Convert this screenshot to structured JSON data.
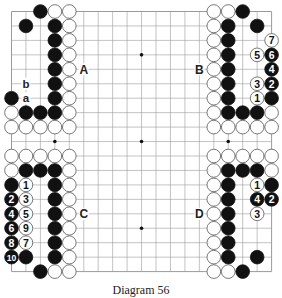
{
  "diagram": {
    "caption": "Diagram 56",
    "board_size": 19,
    "origin": {
      "x": 11.5,
      "y": 11.5
    },
    "spacing": 14.45,
    "colors": {
      "line": "#9a9a9a",
      "black": "#111111",
      "white": "#ffffff",
      "stone_outline": "#555555",
      "label": "#222222"
    },
    "star_points": [
      [
        3,
        3
      ],
      [
        9,
        3
      ],
      [
        15,
        3
      ],
      [
        3,
        9
      ],
      [
        9,
        9
      ],
      [
        15,
        9
      ],
      [
        3,
        15
      ],
      [
        9,
        15
      ],
      [
        15,
        15
      ]
    ],
    "region_labels": [
      {
        "text": "A",
        "col": 5,
        "row": 4
      },
      {
        "text": "B",
        "col": 13,
        "row": 4
      },
      {
        "text": "C",
        "col": 5,
        "row": 14
      },
      {
        "text": "D",
        "col": 13,
        "row": 14
      }
    ],
    "point_labels": [
      {
        "text": "b",
        "col": 1,
        "row": 5
      },
      {
        "text": "a",
        "col": 1,
        "row": 6
      }
    ],
    "stones": [
      {
        "c": "B",
        "col": 2,
        "row": 0
      },
      {
        "c": "W",
        "col": 3,
        "row": 0
      },
      {
        "c": "W",
        "col": 4,
        "row": 0
      },
      {
        "c": "B",
        "col": 1,
        "row": 1
      },
      {
        "c": "B",
        "col": 3,
        "row": 1
      },
      {
        "c": "W",
        "col": 4,
        "row": 1
      },
      {
        "c": "B",
        "col": 3,
        "row": 2
      },
      {
        "c": "W",
        "col": 4,
        "row": 2
      },
      {
        "c": "B",
        "col": 3,
        "row": 3
      },
      {
        "c": "W",
        "col": 4,
        "row": 3
      },
      {
        "c": "B",
        "col": 3,
        "row": 4
      },
      {
        "c": "W",
        "col": 4,
        "row": 4
      },
      {
        "c": "B",
        "col": 3,
        "row": 5
      },
      {
        "c": "W",
        "col": 4,
        "row": 5
      },
      {
        "c": "B",
        "col": 0,
        "row": 6
      },
      {
        "c": "B",
        "col": 3,
        "row": 6
      },
      {
        "c": "W",
        "col": 4,
        "row": 6
      },
      {
        "c": "W",
        "col": 0,
        "row": 7
      },
      {
        "c": "B",
        "col": 1,
        "row": 7
      },
      {
        "c": "B",
        "col": 2,
        "row": 7
      },
      {
        "c": "B",
        "col": 3,
        "row": 7
      },
      {
        "c": "W",
        "col": 4,
        "row": 7
      },
      {
        "c": "W",
        "col": 0,
        "row": 8
      },
      {
        "c": "W",
        "col": 1,
        "row": 8
      },
      {
        "c": "W",
        "col": 2,
        "row": 8
      },
      {
        "c": "W",
        "col": 3,
        "row": 8
      },
      {
        "c": "W",
        "col": 4,
        "row": 8
      },
      {
        "c": "W",
        "col": 14,
        "row": 0
      },
      {
        "c": "W",
        "col": 15,
        "row": 0
      },
      {
        "c": "B",
        "col": 16,
        "row": 0
      },
      {
        "c": "W",
        "col": 14,
        "row": 1
      },
      {
        "c": "B",
        "col": 15,
        "row": 1
      },
      {
        "c": "B",
        "col": 17,
        "row": 1
      },
      {
        "c": "W",
        "col": 14,
        "row": 2
      },
      {
        "c": "B",
        "col": 15,
        "row": 2
      },
      {
        "c": "W",
        "col": 18,
        "row": 2,
        "n": "7"
      },
      {
        "c": "W",
        "col": 14,
        "row": 3
      },
      {
        "c": "B",
        "col": 15,
        "row": 3
      },
      {
        "c": "W",
        "col": 17,
        "row": 3,
        "n": "5"
      },
      {
        "c": "B",
        "col": 18,
        "row": 3,
        "n": "6"
      },
      {
        "c": "W",
        "col": 14,
        "row": 4
      },
      {
        "c": "B",
        "col": 15,
        "row": 4
      },
      {
        "c": "B",
        "col": 18,
        "row": 4,
        "n": "4"
      },
      {
        "c": "W",
        "col": 14,
        "row": 5
      },
      {
        "c": "B",
        "col": 15,
        "row": 5
      },
      {
        "c": "W",
        "col": 17,
        "row": 5,
        "n": "3"
      },
      {
        "c": "B",
        "col": 18,
        "row": 5,
        "n": "2"
      },
      {
        "c": "W",
        "col": 14,
        "row": 6
      },
      {
        "c": "B",
        "col": 15,
        "row": 6
      },
      {
        "c": "W",
        "col": 17,
        "row": 6,
        "n": "1"
      },
      {
        "c": "B",
        "col": 18,
        "row": 6
      },
      {
        "c": "W",
        "col": 14,
        "row": 7
      },
      {
        "c": "B",
        "col": 15,
        "row": 7
      },
      {
        "c": "B",
        "col": 16,
        "row": 7
      },
      {
        "c": "B",
        "col": 17,
        "row": 7
      },
      {
        "c": "W",
        "col": 18,
        "row": 7
      },
      {
        "c": "W",
        "col": 14,
        "row": 8
      },
      {
        "c": "W",
        "col": 15,
        "row": 8
      },
      {
        "c": "W",
        "col": 16,
        "row": 8
      },
      {
        "c": "W",
        "col": 17,
        "row": 8
      },
      {
        "c": "W",
        "col": 18,
        "row": 8
      },
      {
        "c": "W",
        "col": 0,
        "row": 10
      },
      {
        "c": "W",
        "col": 1,
        "row": 10
      },
      {
        "c": "W",
        "col": 2,
        "row": 10
      },
      {
        "c": "W",
        "col": 3,
        "row": 10
      },
      {
        "c": "W",
        "col": 4,
        "row": 10
      },
      {
        "c": "W",
        "col": 0,
        "row": 11
      },
      {
        "c": "B",
        "col": 1,
        "row": 11
      },
      {
        "c": "B",
        "col": 2,
        "row": 11
      },
      {
        "c": "B",
        "col": 3,
        "row": 11
      },
      {
        "c": "W",
        "col": 4,
        "row": 11
      },
      {
        "c": "B",
        "col": 0,
        "row": 12
      },
      {
        "c": "W",
        "col": 1,
        "row": 12,
        "n": "1"
      },
      {
        "c": "B",
        "col": 3,
        "row": 12
      },
      {
        "c": "W",
        "col": 4,
        "row": 12
      },
      {
        "c": "B",
        "col": 0,
        "row": 13,
        "n": "2"
      },
      {
        "c": "W",
        "col": 1,
        "row": 13,
        "n": "3"
      },
      {
        "c": "B",
        "col": 3,
        "row": 13
      },
      {
        "c": "W",
        "col": 4,
        "row": 13
      },
      {
        "c": "B",
        "col": 0,
        "row": 14,
        "n": "4"
      },
      {
        "c": "W",
        "col": 1,
        "row": 14,
        "n": "5"
      },
      {
        "c": "B",
        "col": 3,
        "row": 14
      },
      {
        "c": "W",
        "col": 4,
        "row": 14
      },
      {
        "c": "B",
        "col": 0,
        "row": 15,
        "n": "6"
      },
      {
        "c": "W",
        "col": 1,
        "row": 15,
        "n": "9"
      },
      {
        "c": "B",
        "col": 3,
        "row": 15
      },
      {
        "c": "W",
        "col": 4,
        "row": 15
      },
      {
        "c": "B",
        "col": 0,
        "row": 16,
        "n": "8"
      },
      {
        "c": "W",
        "col": 1,
        "row": 16,
        "n": "7"
      },
      {
        "c": "B",
        "col": 3,
        "row": 16
      },
      {
        "c": "W",
        "col": 4,
        "row": 16
      },
      {
        "c": "B",
        "col": 0,
        "row": 17,
        "n": "10"
      },
      {
        "c": "B",
        "col": 1,
        "row": 17
      },
      {
        "c": "B",
        "col": 3,
        "row": 17
      },
      {
        "c": "W",
        "col": 4,
        "row": 17
      },
      {
        "c": "B",
        "col": 2,
        "row": 18
      },
      {
        "c": "W",
        "col": 3,
        "row": 18
      },
      {
        "c": "W",
        "col": 4,
        "row": 18
      },
      {
        "c": "W",
        "col": 14,
        "row": 10
      },
      {
        "c": "W",
        "col": 15,
        "row": 10
      },
      {
        "c": "W",
        "col": 16,
        "row": 10
      },
      {
        "c": "W",
        "col": 17,
        "row": 10
      },
      {
        "c": "W",
        "col": 18,
        "row": 10
      },
      {
        "c": "W",
        "col": 14,
        "row": 11
      },
      {
        "c": "B",
        "col": 15,
        "row": 11
      },
      {
        "c": "B",
        "col": 16,
        "row": 11
      },
      {
        "c": "B",
        "col": 17,
        "row": 11
      },
      {
        "c": "W",
        "col": 18,
        "row": 11
      },
      {
        "c": "W",
        "col": 14,
        "row": 12
      },
      {
        "c": "B",
        "col": 15,
        "row": 12
      },
      {
        "c": "W",
        "col": 17,
        "row": 12,
        "n": "1"
      },
      {
        "c": "B",
        "col": 18,
        "row": 12
      },
      {
        "c": "W",
        "col": 14,
        "row": 13
      },
      {
        "c": "B",
        "col": 15,
        "row": 13
      },
      {
        "c": "B",
        "col": 17,
        "row": 13,
        "n": "4"
      },
      {
        "c": "B",
        "col": 18,
        "row": 13,
        "n": "2"
      },
      {
        "c": "W",
        "col": 14,
        "row": 14
      },
      {
        "c": "B",
        "col": 15,
        "row": 14
      },
      {
        "c": "W",
        "col": 17,
        "row": 14,
        "n": "3"
      },
      {
        "c": "W",
        "col": 14,
        "row": 15
      },
      {
        "c": "B",
        "col": 15,
        "row": 15
      },
      {
        "c": "W",
        "col": 14,
        "row": 16
      },
      {
        "c": "B",
        "col": 15,
        "row": 16
      },
      {
        "c": "W",
        "col": 14,
        "row": 17
      },
      {
        "c": "B",
        "col": 15,
        "row": 17
      },
      {
        "c": "B",
        "col": 17,
        "row": 17
      },
      {
        "c": "W",
        "col": 14,
        "row": 18
      },
      {
        "c": "W",
        "col": 15,
        "row": 18
      },
      {
        "c": "B",
        "col": 16,
        "row": 18
      }
    ]
  }
}
